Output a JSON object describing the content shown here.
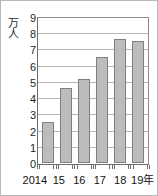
{
  "chart_data": {
    "type": "bar",
    "title": "",
    "subtitle": "",
    "xlabel": "",
    "ylabel": "万人",
    "unit_label": "万人",
    "unit_label_chars": [
      "万",
      "人"
    ],
    "categories": [
      "2014",
      "15",
      "16",
      "17",
      "18",
      "19年"
    ],
    "values": [
      2.5,
      4.65,
      5.2,
      6.55,
      7.65,
      7.55
    ],
    "ylim": [
      0,
      9
    ],
    "ytick_labels": [
      "0",
      "1",
      "2",
      "3",
      "4",
      "5",
      "6",
      "7",
      "8",
      "9"
    ],
    "ytick_values": [
      0,
      1,
      2,
      3,
      4,
      5,
      6,
      7,
      8,
      9
    ],
    "grid": true,
    "grid_axis": "y",
    "legend": false,
    "legend_position": "none",
    "series": [
      {
        "name": "",
        "values": [
          2.5,
          4.65,
          5.2,
          6.55,
          7.65,
          7.55
        ]
      }
    ],
    "colors": {
      "bar_fill": "#bcbcbc",
      "bar_border": "#808080",
      "gridline": "#b5b5b5",
      "axis": "#6e6e6e",
      "background": "#ffffff",
      "text": "#111111",
      "frame": "#b9b9b9"
    }
  }
}
